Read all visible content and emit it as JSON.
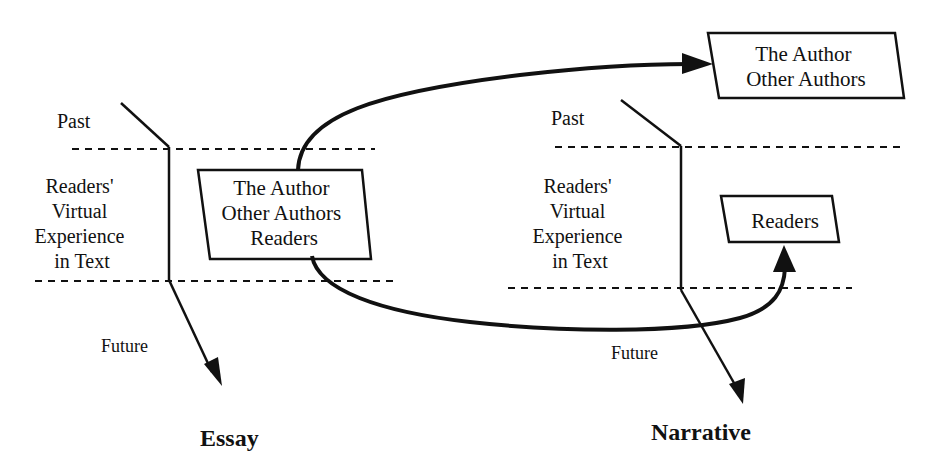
{
  "essay": {
    "title": "Essay",
    "past_label": "Past",
    "future_label": "Future",
    "region_label": [
      "Readers'",
      "Virtual",
      "Experience",
      "in Text"
    ],
    "box_lines": [
      "The Author",
      "Other Authors",
      "Readers"
    ]
  },
  "narrative": {
    "title": "Narrative",
    "past_label": "Past",
    "future_label": "Future",
    "region_label": [
      "Readers'",
      "Virtual",
      "Experience",
      "in Text"
    ],
    "author_box_lines": [
      "The Author",
      "Other Authors"
    ],
    "readers_box_label": "Readers"
  },
  "colors": {
    "ink": "#111111",
    "background": "#ffffff"
  }
}
